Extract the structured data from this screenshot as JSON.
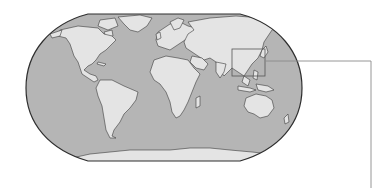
{
  "map": {
    "projection": "robinson",
    "type": "world-map",
    "colors": {
      "ocean": "#b5b5b5",
      "land": "#e4e4e4",
      "coast": "#3a3a3a",
      "outline": "#2e2e2e",
      "highlight_box": "#555555",
      "callout_line": "#8a8a8a",
      "background": "#ffffff"
    },
    "highlight_region": {
      "label": "East Asia",
      "box": {
        "x": 232,
        "y": 49,
        "width": 33,
        "height": 27
      }
    },
    "callout": {
      "points": [
        [
          265,
          61
        ],
        [
          371,
          61
        ],
        [
          371,
          188
        ]
      ]
    }
  }
}
